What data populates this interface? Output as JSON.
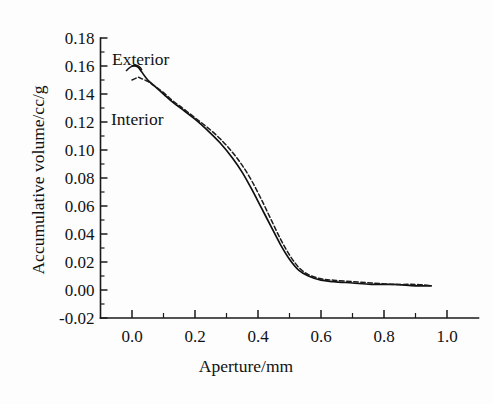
{
  "chart_data": {
    "type": "line",
    "title": "",
    "xlabel": "Aperture/mm",
    "ylabel": "Accumulative volume/cc/g",
    "xlim": [
      -0.1,
      1.1
    ],
    "ylim": [
      -0.02,
      0.18
    ],
    "grid": false,
    "legend_position": "inline-annotations",
    "x_ticks": [
      "0.0",
      "0.2",
      "0.4",
      "0.6",
      "0.8",
      "1.0"
    ],
    "x_tick_values": [
      0.0,
      0.2,
      0.4,
      0.6,
      0.8,
      1.0
    ],
    "x_minor_tick_values": [
      0.1,
      0.3,
      0.5,
      0.7,
      0.9
    ],
    "y_ticks": [
      "0.18",
      "0.16",
      "0.14",
      "0.12",
      "0.10",
      "0.08",
      "0.06",
      "0.04",
      "0.02",
      "0.00",
      "-0.02"
    ],
    "y_tick_values": [
      0.18,
      0.16,
      0.14,
      0.12,
      0.1,
      0.08,
      0.06,
      0.04,
      0.02,
      0.0,
      -0.02
    ],
    "series": [
      {
        "name": "Exterior",
        "style": "solid",
        "x": [
          0.0,
          0.01,
          0.02,
          0.03,
          0.05,
          0.07,
          0.1,
          0.13,
          0.16,
          0.2,
          0.24,
          0.28,
          0.32,
          0.35,
          0.38,
          0.41,
          0.44,
          0.47,
          0.5,
          0.53,
          0.56,
          0.6,
          0.64,
          0.7,
          0.76,
          0.83,
          0.9,
          0.95
        ],
        "y": [
          0.16,
          0.16,
          0.159,
          0.156,
          0.15,
          0.146,
          0.14,
          0.134,
          0.129,
          0.122,
          0.114,
          0.105,
          0.094,
          0.084,
          0.072,
          0.059,
          0.046,
          0.033,
          0.022,
          0.014,
          0.01,
          0.007,
          0.006,
          0.005,
          0.004,
          0.004,
          0.003,
          0.003
        ]
      },
      {
        "name": "Interior",
        "style": "dashed",
        "x": [
          0.0,
          0.01,
          0.02,
          0.03,
          0.05,
          0.07,
          0.1,
          0.13,
          0.16,
          0.2,
          0.24,
          0.28,
          0.32,
          0.35,
          0.38,
          0.41,
          0.44,
          0.47,
          0.5,
          0.53,
          0.56,
          0.6,
          0.64,
          0.7,
          0.76,
          0.83,
          0.9,
          0.95
        ],
        "y": [
          0.15,
          0.151,
          0.152,
          0.151,
          0.149,
          0.146,
          0.141,
          0.135,
          0.13,
          0.123,
          0.116,
          0.108,
          0.098,
          0.089,
          0.078,
          0.065,
          0.051,
          0.037,
          0.025,
          0.016,
          0.011,
          0.008,
          0.007,
          0.006,
          0.005,
          0.004,
          0.004,
          0.003
        ]
      }
    ],
    "annotations": [
      {
        "text": "Exterior",
        "x_px": 112,
        "y_px": 65
      },
      {
        "text": "Interior",
        "x_px": 111,
        "y_px": 125
      }
    ]
  }
}
